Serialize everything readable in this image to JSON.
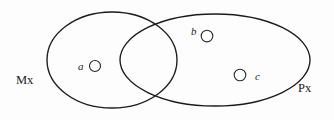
{
  "diagram": {
    "type": "venn-diagram",
    "title": "",
    "background_color": "#fdfdfd",
    "stroke_color": "#1a1a1a",
    "sets": [
      {
        "id": "left-set",
        "label": "Mx",
        "label_x": 30,
        "label_y": 80,
        "cx": 112,
        "cy": 60,
        "rx": 65,
        "ry": 48
      },
      {
        "id": "right-set",
        "label": "Px",
        "label_x": 312,
        "label_y": 88,
        "cx": 215,
        "cy": 60,
        "rx": 95,
        "ry": 46
      }
    ],
    "members": [
      {
        "id": "member-a",
        "label": "a",
        "region": "left-only",
        "label_x": 78,
        "label_y": 70,
        "dot_cx": 95,
        "dot_cy": 66,
        "dot_r": 5.5
      },
      {
        "id": "member-b",
        "label": "b",
        "region": "right-only",
        "label_x": 191,
        "label_y": 35,
        "dot_cx": 207,
        "dot_cy": 36,
        "dot_r": 5.8
      },
      {
        "id": "member-c",
        "label": "c",
        "region": "right-only",
        "label_x": 255,
        "label_y": 80,
        "dot_cx": 240,
        "dot_cy": 75,
        "dot_r": 5.8
      }
    ]
  }
}
